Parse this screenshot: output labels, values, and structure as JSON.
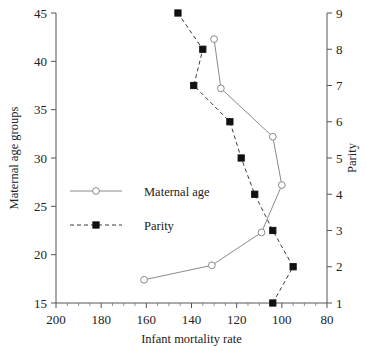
{
  "chart_data": {
    "type": "line",
    "title": "",
    "xlabel": "Infant mortality rate",
    "ylabel": "Maternal age groups",
    "y2label": "Parity",
    "xlim": [
      200,
      80
    ],
    "x_reversed": true,
    "xticks": [
      200,
      180,
      160,
      140,
      120,
      100,
      80
    ],
    "xminor_step": 5,
    "ylim": [
      15,
      45
    ],
    "yticks": [
      15,
      20,
      25,
      30,
      35,
      40,
      45
    ],
    "y2lim": [
      1,
      9
    ],
    "y2ticks": [
      1,
      2,
      3,
      4,
      5,
      6,
      7,
      8,
      9
    ],
    "grid": false,
    "legend_position": "center-left",
    "series": [
      {
        "name": "Maternal age",
        "axis": "left",
        "marker": "open-circle",
        "linestyle": "solid",
        "color": "#8a8a8a",
        "points": [
          {
            "x": 161,
            "y": 17.4
          },
          {
            "x": 131,
            "y": 18.9
          },
          {
            "x": 109,
            "y": 22.3
          },
          {
            "x": 100,
            "y": 27.2
          },
          {
            "x": 104,
            "y": 32.2
          },
          {
            "x": 127,
            "y": 37.2
          },
          {
            "x": 130,
            "y": 42.3
          }
        ]
      },
      {
        "name": "Parity",
        "axis": "right",
        "marker": "filled-square",
        "linestyle": "dashed",
        "color": "#111111",
        "points": [
          {
            "x": 104,
            "y": 1
          },
          {
            "x": 95,
            "y": 2
          },
          {
            "x": 104,
            "y": 3
          },
          {
            "x": 112,
            "y": 4
          },
          {
            "x": 118,
            "y": 5
          },
          {
            "x": 123,
            "y": 6
          },
          {
            "x": 139,
            "y": 7
          },
          {
            "x": 135,
            "y": 8
          },
          {
            "x": 146,
            "y": 9
          }
        ]
      }
    ]
  },
  "labels": {
    "x_axis_title": "Infant mortality rate",
    "y_axis_title": "Maternal age groups",
    "y2_axis_title": "Parity",
    "legend": [
      {
        "key": "maternal-age",
        "label": "Maternal age"
      },
      {
        "key": "parity",
        "label": "Parity"
      }
    ]
  }
}
